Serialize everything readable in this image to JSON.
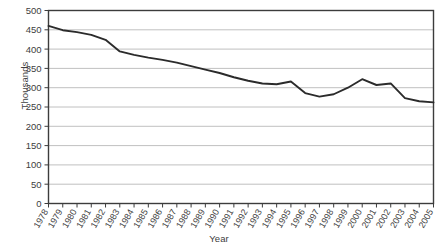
{
  "chart_data": {
    "type": "line",
    "title": "",
    "xlabel": "Year",
    "ylabel": "Thousands",
    "grid": true,
    "legend": false,
    "xlim": [
      1978,
      2005
    ],
    "ylim": [
      0,
      500
    ],
    "ytick_labels": [
      "500",
      "450",
      "400",
      "350",
      "300",
      "250",
      "200",
      "150",
      "100",
      "50",
      "0"
    ],
    "yticks": [
      500,
      450,
      400,
      350,
      300,
      250,
      200,
      150,
      100,
      50,
      0
    ],
    "categories": [
      "1978",
      "1979",
      "1980",
      "1981",
      "1982",
      "1983",
      "1984",
      "1985",
      "1986",
      "1987",
      "1988",
      "1989",
      "1990",
      "1991",
      "1992",
      "1993",
      "1994",
      "1995",
      "1996",
      "1997",
      "1998",
      "1999",
      "2000",
      "2001",
      "2002",
      "2003",
      "2004",
      "2005"
    ],
    "x": [
      1978,
      1979,
      1980,
      1981,
      1982,
      1983,
      1984,
      1985,
      1986,
      1987,
      1988,
      1989,
      1990,
      1991,
      1992,
      1993,
      1994,
      1995,
      1996,
      1997,
      1998,
      1999,
      2000,
      2001,
      2002,
      2003,
      2004,
      2005
    ],
    "values": [
      460,
      449,
      444,
      437,
      424,
      394,
      385,
      378,
      372,
      365,
      356,
      347,
      338,
      327,
      318,
      311,
      309,
      316,
      286,
      277,
      283,
      300,
      322,
      307,
      311,
      273,
      265,
      262
    ],
    "series": [
      {
        "name": "series-1",
        "color": "#2b2b2b",
        "values": [
          460,
          449,
          444,
          437,
          424,
          394,
          385,
          378,
          372,
          365,
          356,
          347,
          338,
          327,
          318,
          311,
          309,
          316,
          286,
          277,
          283,
          300,
          322,
          307,
          311,
          273,
          265,
          262
        ]
      }
    ]
  },
  "axes": {
    "ylabel": "Thousands",
    "xlabel": "Year"
  },
  "colors": {
    "line": "#2b2b2b",
    "grid": "#b0b0b0",
    "frame": "#3c3c3c",
    "plot_background": "#ffffff",
    "tick_text": "#404040"
  }
}
